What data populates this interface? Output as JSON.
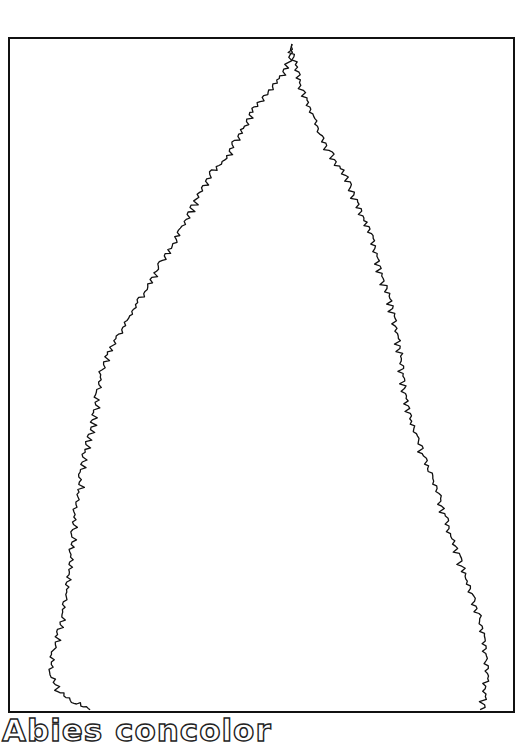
{
  "figure": {
    "caption": "Abies concolor",
    "line_color": "#111111",
    "background": "#ffffff",
    "frame": {
      "left": 8,
      "top": 37,
      "right": 513,
      "bottom": 711
    },
    "silhouette": {
      "description": "jagged conifer outline",
      "left_edge": [
        [
          292,
          44
        ],
        [
          288,
          60
        ],
        [
          280,
          76
        ],
        [
          270,
          88
        ],
        [
          262,
          100
        ],
        [
          250,
          110
        ],
        [
          244,
          126
        ],
        [
          234,
          140
        ],
        [
          226,
          158
        ],
        [
          212,
          170
        ],
        [
          200,
          190
        ],
        [
          190,
          210
        ],
        [
          180,
          228
        ],
        [
          172,
          246
        ],
        [
          160,
          262
        ],
        [
          150,
          282
        ],
        [
          138,
          300
        ],
        [
          128,
          318
        ],
        [
          116,
          336
        ],
        [
          108,
          352
        ],
        [
          100,
          372
        ],
        [
          96,
          392
        ],
        [
          94,
          410
        ],
        [
          90,
          432
        ],
        [
          84,
          452
        ],
        [
          80,
          472
        ],
        [
          78,
          492
        ],
        [
          74,
          512
        ],
        [
          72,
          532
        ],
        [
          70,
          552
        ],
        [
          68,
          572
        ],
        [
          66,
          592
        ],
        [
          62,
          612
        ],
        [
          58,
          632
        ],
        [
          52,
          652
        ],
        [
          50,
          672
        ],
        [
          56,
          690
        ],
        [
          72,
          702
        ],
        [
          90,
          710
        ]
      ],
      "right_edge": [
        [
          292,
          44
        ],
        [
          296,
          62
        ],
        [
          300,
          80
        ],
        [
          306,
          98
        ],
        [
          314,
          116
        ],
        [
          320,
          134
        ],
        [
          330,
          150
        ],
        [
          340,
          166
        ],
        [
          350,
          182
        ],
        [
          356,
          200
        ],
        [
          364,
          218
        ],
        [
          372,
          236
        ],
        [
          378,
          256
        ],
        [
          382,
          276
        ],
        [
          390,
          296
        ],
        [
          394,
          316
        ],
        [
          398,
          336
        ],
        [
          402,
          356
        ],
        [
          404,
          376
        ],
        [
          406,
          396
        ],
        [
          410,
          416
        ],
        [
          418,
          436
        ],
        [
          424,
          456
        ],
        [
          432,
          476
        ],
        [
          440,
          496
        ],
        [
          446,
          516
        ],
        [
          452,
          536
        ],
        [
          460,
          556
        ],
        [
          466,
          576
        ],
        [
          474,
          596
        ],
        [
          480,
          616
        ],
        [
          484,
          636
        ],
        [
          486,
          656
        ],
        [
          488,
          676
        ],
        [
          486,
          694
        ],
        [
          484,
          710
        ]
      ]
    }
  }
}
